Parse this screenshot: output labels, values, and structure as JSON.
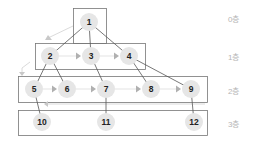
{
  "diagram": {
    "type": "bfs-tree-levels",
    "colors": {
      "node_fill": "#e6e6e6",
      "node_text": "#222222",
      "edge": "#555555",
      "box_stroke": "#777777",
      "arrow": "#b0b0b0",
      "label": "#b5b5b5"
    },
    "layers": [
      {
        "label": "0층",
        "box": {
          "x": 73,
          "y": 8,
          "w": 33,
          "h": 35
        },
        "label_pos": {
          "x": 228,
          "y": 13
        }
      },
      {
        "label": "1층",
        "box": {
          "x": 35,
          "y": 43,
          "w": 110,
          "h": 26
        },
        "label_pos": {
          "x": 228,
          "y": 51
        }
      },
      {
        "label": "2층",
        "box": {
          "x": 18,
          "y": 76,
          "w": 189,
          "h": 26
        },
        "label_pos": {
          "x": 228,
          "y": 85
        }
      },
      {
        "label": "3층",
        "box": {
          "x": 18,
          "y": 110,
          "w": 189,
          "h": 25
        },
        "label_pos": {
          "x": 228,
          "y": 118
        }
      }
    ],
    "nodes": [
      {
        "id": "1",
        "x": 89,
        "y": 22
      },
      {
        "id": "2",
        "x": 50,
        "y": 56
      },
      {
        "id": "3",
        "x": 91,
        "y": 56
      },
      {
        "id": "4",
        "x": 129,
        "y": 56
      },
      {
        "id": "5",
        "x": 34,
        "y": 89
      },
      {
        "id": "6",
        "x": 67,
        "y": 89
      },
      {
        "id": "7",
        "x": 106,
        "y": 89
      },
      {
        "id": "8",
        "x": 151,
        "y": 89
      },
      {
        "id": "9",
        "x": 191,
        "y": 89
      },
      {
        "id": "10",
        "x": 42,
        "y": 122
      },
      {
        "id": "11",
        "x": 106,
        "y": 122
      },
      {
        "id": "12",
        "x": 194,
        "y": 122
      }
    ],
    "edges": [
      [
        "1",
        "2"
      ],
      [
        "1",
        "3"
      ],
      [
        "1",
        "4"
      ],
      [
        "2",
        "5"
      ],
      [
        "2",
        "6"
      ],
      [
        "3",
        "7"
      ],
      [
        "4",
        "8"
      ],
      [
        "4",
        "9"
      ],
      [
        "5",
        "10"
      ],
      [
        "7",
        "11"
      ],
      [
        "9",
        "12"
      ]
    ],
    "traversal_arrows": [
      [
        "2",
        "3"
      ],
      [
        "3",
        "4"
      ],
      [
        "5",
        "6"
      ],
      [
        "6",
        "7"
      ],
      [
        "7",
        "8"
      ],
      [
        "8",
        "9"
      ]
    ]
  }
}
